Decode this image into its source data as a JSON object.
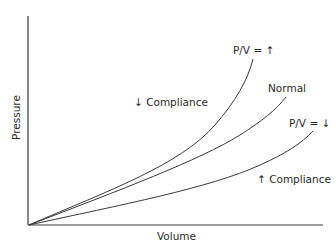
{
  "diagram": {
    "type": "pressure-volume compliance curves",
    "axes": {
      "x_label": "Volume",
      "y_label": "Pressure"
    },
    "curves": [
      {
        "name": "high-pv",
        "label": "P/V = ↑",
        "description": "decreased compliance curve (steepest)"
      },
      {
        "name": "normal",
        "label": "Normal",
        "description": "normal compliance curve"
      },
      {
        "name": "low-pv",
        "label": "P/V = ↓",
        "description": "increased compliance curve (flattest)"
      }
    ],
    "annotations": {
      "decreased_compliance": "↓ Compliance",
      "increased_compliance": "↑ Compliance"
    },
    "colors": {
      "line": "#3a3a3a",
      "text": "#2a2a2a",
      "background": "#ffffff"
    }
  }
}
